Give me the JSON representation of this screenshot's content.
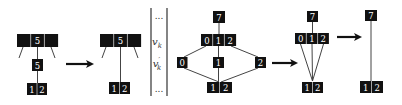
{
  "colors": {
    "box_fill": "#111111",
    "cell_divider": "#bbbbbb",
    "edge": "#444444",
    "arrow": "#111111",
    "text_on_box": "#ffffff"
  },
  "figure": {
    "trees": [
      {
        "id": "tree-1",
        "nodes": [
          {
            "name": "node-top",
            "x": 17,
            "y": 34,
            "cell_w": 13.7,
            "h": 13,
            "cells": [
              "",
              "5",
              ""
            ]
          },
          {
            "name": "node-mid",
            "x": 32,
            "y": 59,
            "cell_w": 11,
            "h": 12,
            "cells": [
              "5"
            ]
          },
          {
            "name": "node-bottom",
            "x": 27,
            "y": 83,
            "cell_w": 10,
            "h": 12,
            "cells": [
              "1",
              "2"
            ]
          }
        ],
        "edges": [
          {
            "x1": 37.5,
            "y1": 47,
            "x2": 37.5,
            "y2": 59
          },
          {
            "x1": 37.5,
            "y1": 71,
            "x2": 37.5,
            "y2": 83
          },
          {
            "x1": 23,
            "y1": 47,
            "x2": 19,
            "y2": 58
          },
          {
            "x1": 51,
            "y1": 47,
            "x2": 55,
            "y2": 58
          }
        ]
      },
      {
        "id": "tree-2",
        "nodes": [
          {
            "name": "node-top",
            "x": 100,
            "y": 34,
            "cell_w": 13.7,
            "h": 13,
            "cells": [
              "",
              "5",
              ""
            ]
          },
          {
            "name": "node-bottom",
            "x": 109,
            "y": 82,
            "cell_w": 10.5,
            "h": 12,
            "cells": [
              "1",
              "2"
            ]
          }
        ],
        "edges": [
          {
            "x1": 120.5,
            "y1": 47,
            "x2": 120.5,
            "y2": 82
          },
          {
            "x1": 106,
            "y1": 47,
            "x2": 102,
            "y2": 58
          },
          {
            "x1": 134,
            "y1": 47,
            "x2": 138,
            "y2": 58
          }
        ]
      },
      {
        "id": "tree-3",
        "nodes": [
          {
            "name": "node-root",
            "x": 213,
            "y": 11,
            "cell_w": 12,
            "h": 12,
            "cells": [
              "7"
            ]
          },
          {
            "name": "node-mid",
            "x": 201,
            "y": 34,
            "cell_w": 11.7,
            "h": 12,
            "cells": [
              "0",
              "1",
              "2"
            ]
          },
          {
            "name": "node-left",
            "x": 177,
            "y": 57,
            "cell_w": 10.5,
            "h": 11,
            "cells": [
              "0"
            ]
          },
          {
            "name": "node-center",
            "x": 213,
            "y": 57,
            "cell_w": 11,
            "h": 11,
            "cells": [
              "1"
            ]
          },
          {
            "name": "node-right",
            "x": 255,
            "y": 57,
            "cell_w": 11,
            "h": 11,
            "cells": [
              "2"
            ]
          },
          {
            "name": "node-bottom",
            "x": 207,
            "y": 82,
            "cell_w": 12.5,
            "h": 11,
            "cells": [
              "1",
              "2"
            ]
          }
        ],
        "edges": [
          {
            "x1": 219,
            "y1": 23,
            "x2": 219,
            "y2": 34
          },
          {
            "x1": 206,
            "y1": 46,
            "x2": 184,
            "y2": 57
          },
          {
            "x1": 218.5,
            "y1": 46,
            "x2": 218.5,
            "y2": 57
          },
          {
            "x1": 231,
            "y1": 46,
            "x2": 258,
            "y2": 57
          },
          {
            "x1": 184,
            "y1": 68,
            "x2": 219,
            "y2": 82
          },
          {
            "x1": 218.5,
            "y1": 68,
            "x2": 218.5,
            "y2": 82
          },
          {
            "x1": 258,
            "y1": 68,
            "x2": 221,
            "y2": 82
          }
        ]
      },
      {
        "id": "tree-4",
        "nodes": [
          {
            "name": "node-root",
            "x": 307,
            "y": 11,
            "cell_w": 11,
            "h": 11,
            "cells": [
              "7"
            ]
          },
          {
            "name": "node-mid",
            "x": 295,
            "y": 33,
            "cell_w": 11.3,
            "h": 11,
            "cells": [
              "0",
              "1",
              "2"
            ]
          },
          {
            "name": "node-bottom",
            "x": 302,
            "y": 82,
            "cell_w": 10.5,
            "h": 11,
            "cells": [
              "1",
              "2"
            ]
          }
        ],
        "edges": [
          {
            "x1": 312.5,
            "y1": 22,
            "x2": 312.5,
            "y2": 33
          },
          {
            "x1": 300.5,
            "y1": 44,
            "x2": 312.5,
            "y2": 81
          },
          {
            "x1": 312,
            "y1": 44,
            "x2": 312.5,
            "y2": 81
          },
          {
            "x1": 323.5,
            "y1": 44,
            "x2": 312.5,
            "y2": 81
          }
        ]
      },
      {
        "id": "tree-5",
        "nodes": [
          {
            "name": "node-root",
            "x": 365,
            "y": 10,
            "cell_w": 12,
            "h": 11,
            "cells": [
              "7"
            ]
          },
          {
            "name": "node-bottom",
            "x": 360,
            "y": 81,
            "cell_w": 11.5,
            "h": 12,
            "cells": [
              "1",
              "2"
            ]
          }
        ],
        "edges": [
          {
            "x1": 371,
            "y1": 21,
            "x2": 371,
            "y2": 81
          }
        ]
      }
    ],
    "arrows": [
      {
        "name": "arrow-1",
        "x1": 66,
        "y1": 64,
        "x2": 94,
        "y2": 64
      },
      {
        "name": "arrow-2",
        "x1": 272,
        "y1": 63,
        "x2": 298,
        "y2": 63
      },
      {
        "name": "arrow-3",
        "x1": 337,
        "y1": 37,
        "x2": 362,
        "y2": 37
      }
    ],
    "column": {
      "x_left": 151,
      "x_right": 167,
      "y_top": 8,
      "y_bottom": 96,
      "entries": [
        {
          "text": "...",
          "kind": "dots",
          "y": 19
        },
        {
          "text": "v",
          "sub": "k",
          "prime": false,
          "y": 45
        },
        {
          "text": "v",
          "sub": "k",
          "prime": true,
          "y": 67
        },
        {
          "text": "...",
          "kind": "dots",
          "y": 92
        }
      ]
    }
  }
}
